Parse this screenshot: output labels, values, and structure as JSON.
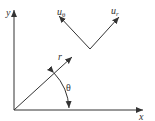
{
  "diagram": {
    "colors": {
      "stroke": "#333333",
      "background": "#ffffff"
    },
    "axes": {
      "x_label": "x",
      "y_label": "y"
    },
    "vectors": {
      "r_label": "r",
      "u_theta_base": "u",
      "u_theta_sub": "θ",
      "u_r_base": "u",
      "u_r_sub": "r"
    },
    "angle": {
      "label": "θ"
    }
  }
}
